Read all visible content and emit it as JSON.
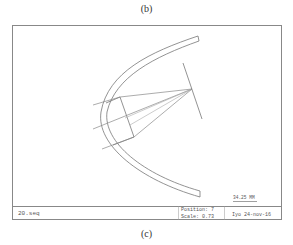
{
  "captions": {
    "top": "(b)",
    "bottom": "(c)"
  },
  "footer": {
    "filename": "20.seq",
    "position_label": "Position: 7",
    "scale_label": "Scale: 0.73",
    "user_date": "Iyo  24-nov-16",
    "scale_bar_label": "34.25   MM"
  },
  "diagram": {
    "type": "optical-layout",
    "elements": [
      "hyperbolic-reflector",
      "lens-block",
      "ray-fan",
      "image-plane"
    ],
    "line_color": "#777777"
  }
}
